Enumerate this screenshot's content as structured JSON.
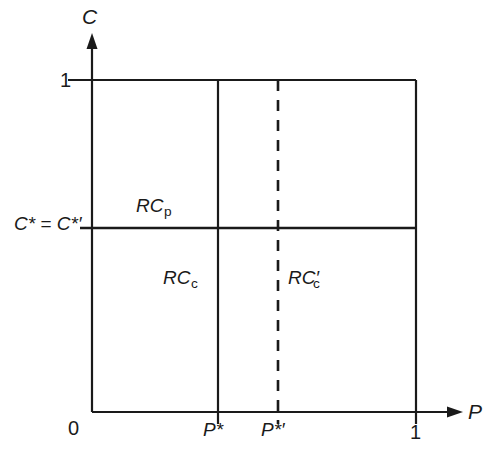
{
  "figure": {
    "type": "economics-region-diagram",
    "background_color": "#ffffff",
    "line_color": "#1a1a1a"
  },
  "axes": {
    "y": {
      "name": "C",
      "arrow": true,
      "ticks": [
        {
          "label": "1",
          "value": 1
        },
        {
          "label": "C* = C*′",
          "value": 0.56
        }
      ]
    },
    "x": {
      "name": "P",
      "arrow": true,
      "ticks": [
        {
          "label": "0",
          "value": 0
        },
        {
          "label": "P*",
          "value": 0.389
        },
        {
          "label": "P*′",
          "value": 0.574
        },
        {
          "label": "1",
          "value": 1
        }
      ]
    }
  },
  "lines": {
    "top_boundary": {
      "style": "solid",
      "orientation": "horizontal",
      "c": 1
    },
    "right_boundary": {
      "style": "solid",
      "orientation": "vertical",
      "p": 1
    },
    "p_star_line": {
      "style": "solid",
      "orientation": "vertical",
      "p": 0.389
    },
    "p_star_prime_line": {
      "style": "dashed",
      "orientation": "vertical",
      "p": 0.574
    },
    "c_star_line": {
      "style": "solid",
      "orientation": "horizontal",
      "c": 0.56
    }
  },
  "regions": [
    {
      "id": "rc-p",
      "base": "RC",
      "subscript": "p",
      "prime": "",
      "label": "RCₚ"
    },
    {
      "id": "rc-c",
      "base": "RC",
      "subscript": "c",
      "prime": "",
      "label": "RCᶜ"
    },
    {
      "id": "rc-c-prime",
      "base": "RC",
      "subscript": "c",
      "prime": "′",
      "label": "RC′ᶜ"
    }
  ],
  "text": {
    "y_axis_name": "C",
    "x_axis_name": "P",
    "y_one": "1",
    "x_zero": "0",
    "x_one": "1",
    "p_star": "P*",
    "p_star_prime": "P*′",
    "c_star_eq": "C*",
    "c_star_equals": " = ",
    "c_star_prime": "C*′",
    "rc_base": "RC",
    "rc_p_sub": "p",
    "rc_c_sub": "c",
    "rc_c_prime_mark": "′"
  }
}
